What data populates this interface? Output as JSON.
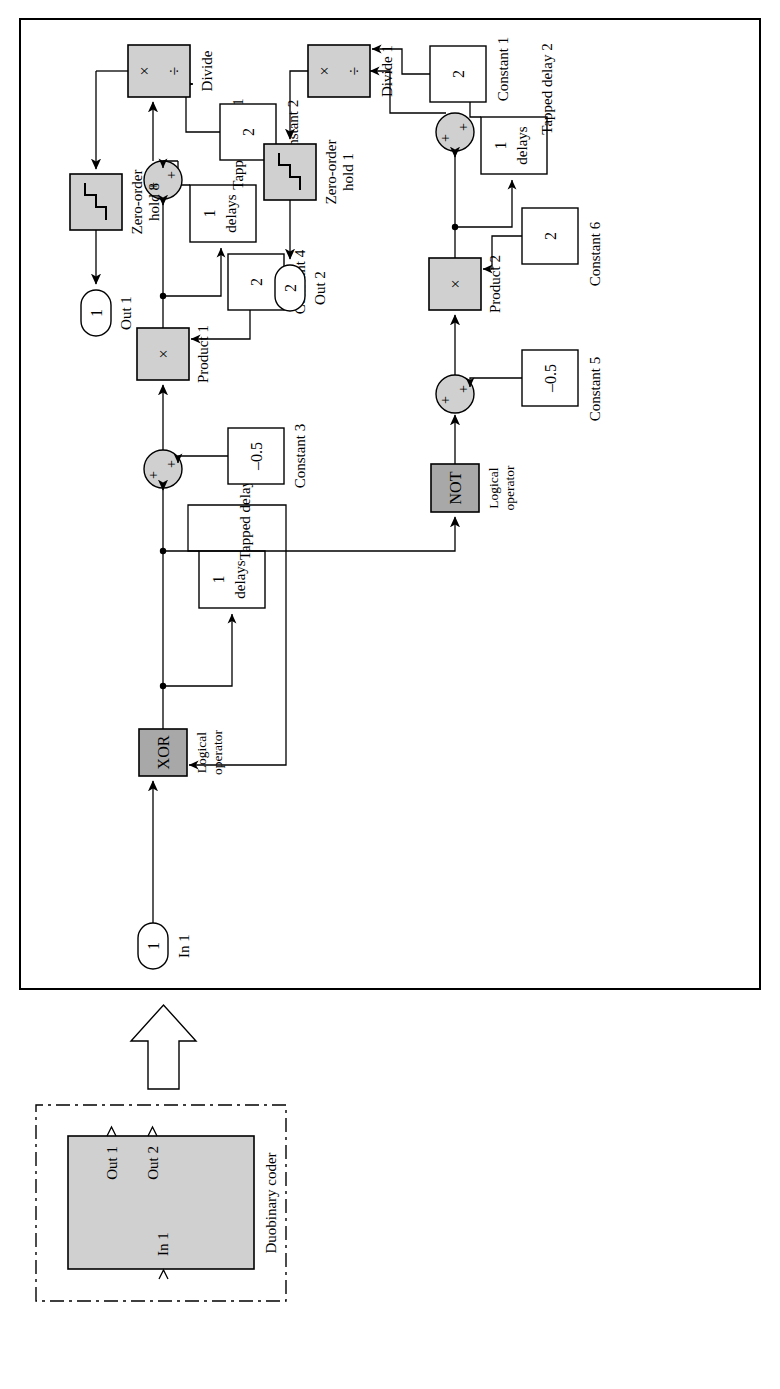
{
  "figure": {
    "type": "simulink-block-diagram",
    "orientation": "rotated-90-ccw",
    "colors": {
      "block_fill_light": "#d0d0d0",
      "block_fill_dark": "#a8a8a8",
      "line": "#000000",
      "background": "#ffffff"
    }
  },
  "left_panel": {
    "name": "duobinary-coder-subsystem",
    "border_style": "dash-dot",
    "caption": "Duobinary coder",
    "block": {
      "inports": [
        "In 1"
      ],
      "outports": [
        "Out 1",
        "Out 2"
      ]
    }
  },
  "arrow": {
    "name": "expand-arrow",
    "direction": "right"
  },
  "right_panel": {
    "name": "duobinary-coder-internals",
    "border_style": "solid"
  },
  "blocks": [
    {
      "id": "in1",
      "kind": "inport",
      "value": "1",
      "label": "In 1"
    },
    {
      "id": "xor",
      "kind": "logic",
      "value": "XOR",
      "label": "Logical\noperator",
      "label_l1": "Logical",
      "label_l2": "operator",
      "fill": "dark"
    },
    {
      "id": "tdelay",
      "kind": "tapped",
      "value_top": "1",
      "value_bottom": "delays",
      "label": "Tapped delay"
    },
    {
      "id": "sum_a",
      "kind": "sum",
      "signs": "++"
    },
    {
      "id": "const3",
      "kind": "constant",
      "value": "-0.5",
      "label": "Constant 3"
    },
    {
      "id": "product1",
      "kind": "product",
      "value": "×",
      "label": "Product 1",
      "fill": "light"
    },
    {
      "id": "const4",
      "kind": "constant",
      "value": "2",
      "label": "Constant 4"
    },
    {
      "id": "tdelay1",
      "kind": "tapped",
      "value_top": "1",
      "value_bottom": "delays",
      "label": "Tapped delay 1"
    },
    {
      "id": "sum_b",
      "kind": "sum",
      "signs": "++"
    },
    {
      "id": "const2",
      "kind": "constant",
      "value": "2",
      "label": "Constant 2"
    },
    {
      "id": "divide",
      "kind": "divide",
      "value_left": "×",
      "value_right": "÷",
      "label": "Divide",
      "fill": "light"
    },
    {
      "id": "zoh8",
      "kind": "zero-order-hold",
      "label_l1": "Zero-order",
      "label_l2": "hold 8",
      "fill": "light"
    },
    {
      "id": "out1",
      "kind": "outport",
      "value": "1",
      "label": "Out 1"
    },
    {
      "id": "not",
      "kind": "logic",
      "value": "NOT",
      "label_l1": "Logical",
      "label_l2": "operator",
      "fill": "dark"
    },
    {
      "id": "sum_c",
      "kind": "sum",
      "signs": "++"
    },
    {
      "id": "const5",
      "kind": "constant",
      "value": "-0.5",
      "label": "Constant 5"
    },
    {
      "id": "product2",
      "kind": "product",
      "value": "×",
      "label": "Product 2",
      "fill": "light"
    },
    {
      "id": "const6",
      "kind": "constant",
      "value": "2",
      "label": "Constant 6"
    },
    {
      "id": "tdelay2",
      "kind": "tapped",
      "value_top": "1",
      "value_bottom": "delays",
      "label": "Tapped delay 2"
    },
    {
      "id": "sum_d",
      "kind": "sum",
      "signs": "++"
    },
    {
      "id": "const1",
      "kind": "constant",
      "value": "2",
      "label": "Constant 1"
    },
    {
      "id": "divide1",
      "kind": "divide",
      "value_left": "×",
      "value_right": "÷",
      "label": "Divide 1",
      "fill": "light"
    },
    {
      "id": "zoh1",
      "kind": "zero-order-hold",
      "label_l1": "Zero-order",
      "label_l2": "hold 1",
      "fill": "light"
    },
    {
      "id": "out2",
      "kind": "outport",
      "value": "2",
      "label": "Out 2"
    }
  ],
  "text": {
    "duobinary_coder": "Duobinary coder",
    "in1_port": "1",
    "in1_label": "In 1",
    "sub_in1": "In 1",
    "sub_out1": "Out 1",
    "sub_out2": "Out 2",
    "xor": "XOR",
    "not": "NOT",
    "logical": "Logical",
    "operator": "operator",
    "tapped_delay": "Tapped delay",
    "tapped_delay_1": "Tapped delay 1",
    "tapped_delay_2": "Tapped delay 2",
    "one": "1",
    "delays": "delays",
    "two": "2",
    "minus_half": "–0.5",
    "constant_1": "Constant 1",
    "constant_2": "Constant 2",
    "constant_3": "Constant 3",
    "constant_4": "Constant 4",
    "constant_5": "Constant 5",
    "constant_6": "Constant 6",
    "product_1": "Product 1",
    "product_2": "Product 2",
    "times": "×",
    "divide_glyph": "÷",
    "divide": "Divide",
    "divide_1": "Divide 1",
    "zero_order": "Zero-order",
    "hold_8": "hold 8",
    "hold_1": "hold 1",
    "out1_port": "1",
    "out1_label": "Out 1",
    "out2_port": "2",
    "out2_label": "Out 2",
    "plus": "+"
  }
}
